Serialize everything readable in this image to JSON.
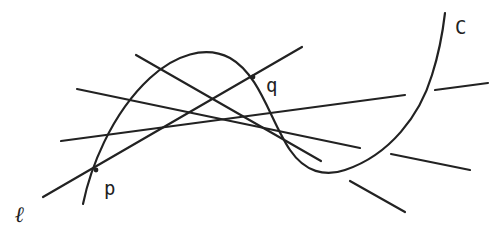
{
  "figure": {
    "stroke_color": "#222222",
    "background": "#ffffff",
    "labels": {
      "curve": "C",
      "line": "ℓ",
      "point_p": "p",
      "point_q": "q"
    },
    "curve_C": {
      "path": "M83,204 C90,170 110,115 150,78 C175,55 205,45 230,58 C260,75 270,120 290,150 C305,172 325,177 345,170 C390,155 420,115 432,75 C440,50 443,30 445,13"
    },
    "line_l": {
      "x1": 43,
      "y1": 197,
      "x2": 302,
      "y2": 47
    },
    "lines": [
      {
        "name": "line-a",
        "x1": 136,
        "y1": 55,
        "x2": 321,
        "y2": 161
      },
      {
        "name": "line-b",
        "x1": 77,
        "y1": 89,
        "x2": 360,
        "y2": 148
      },
      {
        "name": "line-c",
        "x1": 61,
        "y1": 141,
        "x2": 405,
        "y2": 95
      }
    ],
    "segments": [
      {
        "name": "segment-right-upper",
        "x1": 435,
        "y1": 90,
        "x2": 488,
        "y2": 83
      },
      {
        "name": "segment-right-middle",
        "x1": 391,
        "y1": 154,
        "x2": 470,
        "y2": 170
      },
      {
        "name": "segment-bottom",
        "x1": 350,
        "y1": 181,
        "x2": 405,
        "y2": 212
      }
    ],
    "label_positions": {
      "ell": {
        "x": 15,
        "y": 222
      },
      "p": {
        "x": 104,
        "y": 195
      },
      "q": {
        "x": 266,
        "y": 92
      },
      "C": {
        "x": 455,
        "y": 34
      }
    }
  }
}
